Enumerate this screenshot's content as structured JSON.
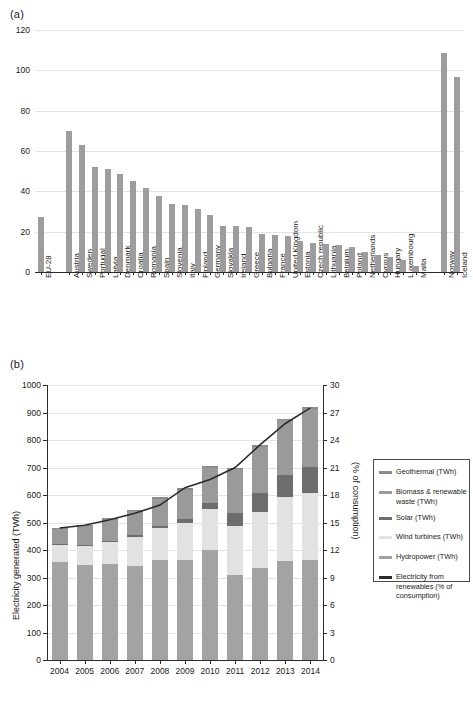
{
  "figure": {
    "panel_a_label": "(a)",
    "panel_b_label": "(b)"
  },
  "chart_data": [
    {
      "id": "a",
      "type": "bar",
      "title": "",
      "xlabel": "",
      "ylabel": "",
      "ylim": [
        0,
        120
      ],
      "yticks": [
        0,
        20,
        40,
        60,
        80,
        100,
        120
      ],
      "grid": true,
      "legend": "none",
      "bar_color": "#9d9d9d",
      "categories": [
        "EU-28",
        "Austria",
        "Sweden",
        "Portugal",
        "Latvia",
        "Denmark",
        "Croatia",
        "Romania",
        "Spain",
        "Slovenia",
        "Italy",
        "Finland",
        "Germany",
        "Slovakia",
        "Ireland",
        "Greece",
        "Bulgaria",
        "France",
        "United Kingdom",
        "Estonia",
        "Czech republic",
        "Lithuania",
        "Belgium",
        "Poland",
        "Netherlands",
        "Cyprus",
        "Hungary",
        "Luxembourg",
        "Malta",
        "Norway",
        "Iceland"
      ],
      "values": [
        27.5,
        70.0,
        63.2,
        52.1,
        51.1,
        48.5,
        45.3,
        41.7,
        37.8,
        33.9,
        33.1,
        31.4,
        28.2,
        22.9,
        22.7,
        22.1,
        18.9,
        18.3,
        17.8,
        15.3,
        14.6,
        13.8,
        13.4,
        12.4,
        10.0,
        8.4,
        7.3,
        5.9,
        3.1,
        108.5,
        96.5
      ],
      "group_gaps_after": [
        "EU-28",
        "Malta"
      ]
    },
    {
      "id": "b",
      "type": "bar",
      "stacked": true,
      "title": "",
      "xlabel": "",
      "ylabel": "Electricity generated (TWh)",
      "ylabel_right": "(% of consumption)",
      "ylim": [
        0,
        1000
      ],
      "yticks": [
        0,
        100,
        200,
        300,
        400,
        500,
        600,
        700,
        800,
        900,
        1000
      ],
      "ylim_right": [
        0,
        30
      ],
      "yticks_right": [
        0,
        3,
        6,
        9,
        12,
        15,
        18,
        21,
        24,
        27,
        30
      ],
      "grid": true,
      "categories": [
        "2004",
        "2005",
        "2006",
        "2007",
        "2008",
        "2009",
        "2010",
        "2011",
        "2012",
        "2013",
        "2014"
      ],
      "series": [
        {
          "name": "Hydropower (TWh)",
          "color": "#a3a3a3",
          "values": [
            358,
            344,
            348,
            342,
            362,
            362,
            400,
            310,
            334,
            360,
            362
          ]
        },
        {
          "name": "Wind turbines (TWh)",
          "color": "#e2e2e2",
          "values": [
            63,
            72,
            82,
            107,
            119,
            136,
            149,
            179,
            204,
            231,
            247
          ]
        },
        {
          "name": "Solar (TWh)",
          "color": "#6d6d6d",
          "values": [
            1,
            2,
            3,
            4,
            8,
            14,
            22,
            45,
            69,
            80,
            92
          ]
        },
        {
          "name": "Biomass & renewable waste (TWh)",
          "color": "#9a9a9a",
          "values": [
            54,
            68,
            77,
            88,
            97,
            108,
            129,
            159,
            168,
            201,
            211
          ]
        },
        {
          "name": "Geothermal (TWh)",
          "color": "#8c8c8c",
          "values": [
            5,
            5,
            5,
            5,
            6,
            6,
            6,
            6,
            6,
            6,
            7
          ]
        }
      ],
      "line_series": {
        "name": "Electricity from renewables (% of consumption)",
        "color": "#2b2b2b",
        "values": [
          14.4,
          14.7,
          15.3,
          16.0,
          16.9,
          18.8,
          19.7,
          21.0,
          23.5,
          25.8,
          27.5
        ]
      }
    }
  ],
  "legend": {
    "items": [
      {
        "label": "Geothermal (TWh)",
        "color": "#8c8c8c"
      },
      {
        "label": "Biomass & renewable waste (TWh)",
        "color": "#9a9a9a"
      },
      {
        "label": "Solar (TWh)",
        "color": "#6d6d6d"
      },
      {
        "label": "Wind turbines (TWh)",
        "color": "#e2e2e2"
      },
      {
        "label": "Hydropower (TWh)",
        "color": "#a3a3a3"
      },
      {
        "label": "Electricity from renewables (% of consumption)",
        "color": "#2b2b2b"
      }
    ]
  }
}
